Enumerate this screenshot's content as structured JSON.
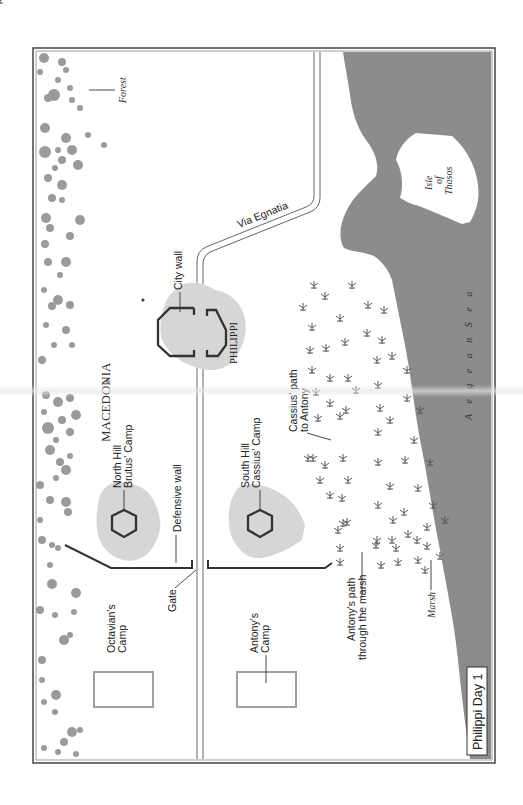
{
  "map": {
    "title": "Philippi Day 1",
    "region_label_letters": [
      "M",
      "A",
      "C",
      "E",
      "D",
      "O",
      "N",
      "I",
      "A"
    ],
    "region_label": "MACEDONIA",
    "labels": {
      "forest": "Forest",
      "isle_line1": "Isle",
      "isle_line2": "of",
      "isle_line3": "Thasos",
      "via_egnatia": "Via Egnatia",
      "city_wall": "City wall",
      "philippi": "PHILIPPI",
      "north_hill_line1": "North Hill",
      "north_hill_line2": "Brutus' Camp",
      "defensive_wall": "Defensive wall",
      "south_hill_line1": "South Hill",
      "south_hill_line2": "Cassius' Camp",
      "cassius_path_line1": "Cassius' path",
      "cassius_path_line2": "to Antony",
      "aegean_sea": "A e g e a n   S e a",
      "gate": "Gate",
      "octavian_line1": "Octavian's",
      "octavian_line2": "Camp",
      "antony_line1": "Antony's",
      "antony_line2": "Camp",
      "antony_path_line1": "Antony's path",
      "antony_path_line2": "through the marsh",
      "marsh": "Marsh"
    },
    "colors": {
      "sea": "#8c8c8c",
      "forest": "#9a9a9a",
      "hill": "#d4d4d4",
      "wall": "#333333",
      "camp_box": "#a0a0a0",
      "frame": "#444444"
    }
  }
}
